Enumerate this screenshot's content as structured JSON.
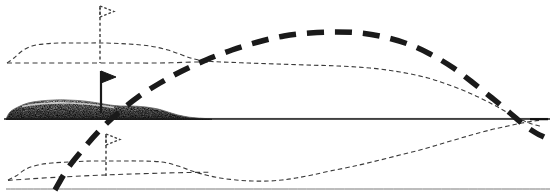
{
  "figure": {
    "width": 550,
    "height": 192,
    "background_color": "#ffffff",
    "ink_color": "#1a1a1a",
    "thin_ink_color": "#3a3a3a",
    "terrain_fill_color": "#4a4a4a",
    "terrain_light_color": "#d8d8d8"
  },
  "chart_data": {
    "type": "line",
    "subtitle": "",
    "xlabel": "",
    "ylabel": "",
    "xlim": [
      0,
      550
    ],
    "ylim": [
      192,
      0
    ],
    "grid": false,
    "legend": "none",
    "annotations": [],
    "tick_labels": {
      "x": [],
      "y": []
    },
    "series": [
      {
        "name": "bold-dashed-trajectory",
        "style": "heavy-dashed",
        "stroke_width": 5.5,
        "dash": "17,11",
        "color": "#1a1a1a",
        "points": [
          [
            55,
            190
          ],
          [
            68,
            168
          ],
          [
            84,
            148
          ],
          [
            100,
            130
          ],
          [
            118,
            113
          ],
          [
            138,
            97
          ],
          [
            160,
            83
          ],
          [
            182,
            71
          ],
          [
            206,
            60
          ],
          [
            232,
            50
          ],
          [
            258,
            42
          ],
          [
            284,
            36
          ],
          [
            310,
            33
          ],
          [
            336,
            32
          ],
          [
            360,
            33
          ],
          [
            384,
            37
          ],
          [
            408,
            44
          ],
          [
            430,
            54
          ],
          [
            452,
            67
          ],
          [
            472,
            82
          ],
          [
            492,
            98
          ],
          [
            510,
            113
          ],
          [
            524,
            125
          ],
          [
            536,
            133
          ],
          [
            544,
            137
          ]
        ]
      },
      {
        "name": "upper-dotted-envelope",
        "style": "fine-dashed",
        "stroke_width": 1.1,
        "dash": "4.5,3",
        "color": "#3a3a3a",
        "points": [
          [
            7,
            63
          ],
          [
            14,
            58
          ],
          [
            22,
            51
          ],
          [
            32,
            46
          ],
          [
            44,
            44
          ],
          [
            60,
            43
          ],
          [
            80,
            43
          ],
          [
            104,
            43
          ],
          [
            128,
            44
          ],
          [
            150,
            46
          ],
          [
            168,
            50
          ],
          [
            182,
            55
          ],
          [
            194,
            59
          ],
          [
            206,
            61
          ],
          [
            222,
            62
          ],
          [
            248,
            63
          ],
          [
            276,
            64
          ],
          [
            306,
            65
          ],
          [
            338,
            66
          ],
          [
            370,
            68
          ],
          [
            400,
            72
          ],
          [
            428,
            78
          ],
          [
            452,
            86
          ],
          [
            474,
            95
          ],
          [
            494,
            105
          ],
          [
            510,
            114
          ],
          [
            522,
            120
          ],
          [
            532,
            124
          ],
          [
            540,
            126
          ]
        ]
      },
      {
        "name": "upper-dashed-baseline",
        "style": "fine-dashed",
        "stroke_width": 1.1,
        "dash": "5,3.5",
        "color": "#3a3a3a",
        "points": [
          [
            7,
            63
          ],
          [
            40,
            63
          ],
          [
            80,
            63
          ],
          [
            120,
            63
          ],
          [
            160,
            63
          ],
          [
            196,
            62
          ],
          [
            210,
            62
          ]
        ]
      },
      {
        "name": "lower-dotted-envelope",
        "style": "fine-dashed",
        "stroke_width": 1.1,
        "dash": "4.5,3",
        "color": "#3a3a3a",
        "points": [
          [
            8,
            180
          ],
          [
            16,
            176
          ],
          [
            26,
            169
          ],
          [
            38,
            165
          ],
          [
            52,
            163
          ],
          [
            70,
            162
          ],
          [
            92,
            161
          ],
          [
            116,
            161
          ],
          [
            140,
            161
          ],
          [
            162,
            162
          ],
          [
            178,
            166
          ],
          [
            192,
            171
          ],
          [
            206,
            175
          ],
          [
            220,
            178
          ],
          [
            236,
            180
          ],
          [
            252,
            181
          ],
          [
            268,
            181
          ],
          [
            282,
            180
          ],
          [
            296,
            178
          ],
          [
            312,
            175
          ],
          [
            330,
            171
          ],
          [
            350,
            167
          ],
          [
            372,
            162
          ],
          [
            396,
            156
          ],
          [
            420,
            150
          ],
          [
            444,
            143
          ],
          [
            468,
            136
          ],
          [
            490,
            130
          ],
          [
            508,
            126
          ],
          [
            522,
            123
          ],
          [
            534,
            121
          ],
          [
            542,
            120
          ]
        ]
      },
      {
        "name": "lower-rising-chord",
        "style": "fine-dashed",
        "stroke_width": 1.1,
        "dash": "5,3.5",
        "color": "#3a3a3a",
        "points": [
          [
            8,
            180
          ],
          [
            60,
            176
          ],
          [
            120,
            173
          ],
          [
            180,
            172
          ],
          [
            210,
            172
          ]
        ]
      },
      {
        "name": "ground-line",
        "style": "solid",
        "stroke_width": 1.6,
        "dash": "none",
        "color": "#1a1a1a",
        "points": [
          [
            4,
            119
          ],
          [
            200,
            119
          ],
          [
            360,
            119
          ],
          [
            550,
            119
          ]
        ]
      },
      {
        "name": "lower-frame-line",
        "style": "solid",
        "stroke_width": 1.0,
        "dash": "none",
        "color": "#7a7a7a",
        "points": [
          [
            6,
            189
          ],
          [
            280,
            189
          ],
          [
            550,
            189
          ]
        ]
      }
    ],
    "terrain": {
      "name": "stippled-embankment",
      "description": "shaded embankment cross-section tapering to the right",
      "outline": [
        [
          6,
          119
        ],
        [
          10,
          112
        ],
        [
          18,
          107
        ],
        [
          28,
          103
        ],
        [
          40,
          101
        ],
        [
          54,
          100
        ],
        [
          68,
          100
        ],
        [
          84,
          101
        ],
        [
          98,
          103
        ],
        [
          110,
          105
        ],
        [
          120,
          106
        ],
        [
          132,
          106
        ],
        [
          146,
          107
        ],
        [
          158,
          109
        ],
        [
          168,
          112
        ],
        [
          178,
          115
        ],
        [
          188,
          117
        ],
        [
          198,
          118
        ],
        [
          212,
          119
        ]
      ]
    },
    "markers": [
      {
        "name": "flag-upper",
        "style": "outline",
        "pole_x": 100,
        "pole_top_y": 6,
        "pole_bottom_y": 63,
        "flag_width": 14,
        "flag_height": 11,
        "fill": "none",
        "stroke": "#3a3a3a",
        "dashed_pole": true
      },
      {
        "name": "flag-middle",
        "style": "filled",
        "pole_x": 101,
        "pole_top_y": 71,
        "pole_bottom_y": 113,
        "flag_width": 15,
        "flag_height": 12,
        "fill": "#1a1a1a",
        "stroke": "#1a1a1a",
        "dashed_pole": false
      },
      {
        "name": "flag-lower",
        "style": "outline",
        "pole_x": 106,
        "pole_top_y": 134,
        "pole_bottom_y": 176,
        "flag_width": 14,
        "flag_height": 11,
        "fill": "none",
        "stroke": "#3a3a3a",
        "dashed_pole": true
      }
    ]
  }
}
